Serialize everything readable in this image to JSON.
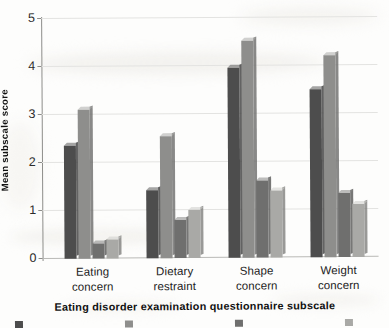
{
  "chart_data": {
    "type": "bar",
    "title": "",
    "subtitle": "",
    "xlabel": "Eating disorder examination questionnaire subscale",
    "ylabel": "Mean subscale score",
    "ylim": [
      0,
      5
    ],
    "yticks": [
      "0",
      "1",
      "2",
      "3",
      "4",
      "5"
    ],
    "grid": true,
    "legend_position": "bottom",
    "legend_cropped": true,
    "categories": [
      "Eating concern",
      "Dietary restraint",
      "Shape concern",
      "Weight concern"
    ],
    "category_lines": [
      [
        "Eating",
        "concern"
      ],
      [
        "Dietary",
        "restraint"
      ],
      [
        "Shape",
        "concern"
      ],
      [
        "Weight",
        "concern"
      ]
    ],
    "series": [
      {
        "name": "",
        "color": "#4d4d4d",
        "values": [
          2.35,
          1.42,
          3.95,
          3.5
        ]
      },
      {
        "name": "",
        "color": "#8e8e8c",
        "values": [
          3.1,
          2.55,
          4.52,
          4.2
        ]
      },
      {
        "name": "",
        "color": "#6f6f6e",
        "values": [
          0.32,
          0.8,
          1.6,
          1.33
        ]
      },
      {
        "name": "",
        "color": "#a9a9a6",
        "values": [
          0.4,
          1.0,
          1.4,
          1.1
        ]
      }
    ]
  },
  "yaxis": {
    "title": "Mean subscale score",
    "ticks": [
      "0",
      "1",
      "2",
      "3",
      "4",
      "5"
    ]
  },
  "xaxis": {
    "title": "Eating disorder examination questionnaire subscale",
    "groups": [
      {
        "line1": "Eating",
        "line2": "concern"
      },
      {
        "line1": "Dietary",
        "line2": "restraint"
      },
      {
        "line1": "Shape",
        "line2": "concern"
      },
      {
        "line1": "Weight",
        "line2": "concern"
      }
    ]
  },
  "legend": {
    "cropped_note": "",
    "entries": [
      {
        "label": "",
        "color": "#4d4d4d"
      },
      {
        "label": "",
        "color": "#8e8e8c"
      },
      {
        "label": "",
        "color": "#6f6f6e"
      },
      {
        "label": "",
        "color": "#a9a9a6"
      }
    ]
  },
  "colors": {
    "series1": "#4d4d4d",
    "series2": "#8e8e8c",
    "series3": "#6f6f6e",
    "series4": "#a9a9a6",
    "grid": "#e3e3e1",
    "axis": "#8d8d8a",
    "text": "#232323",
    "background": "#fdfdfc"
  }
}
